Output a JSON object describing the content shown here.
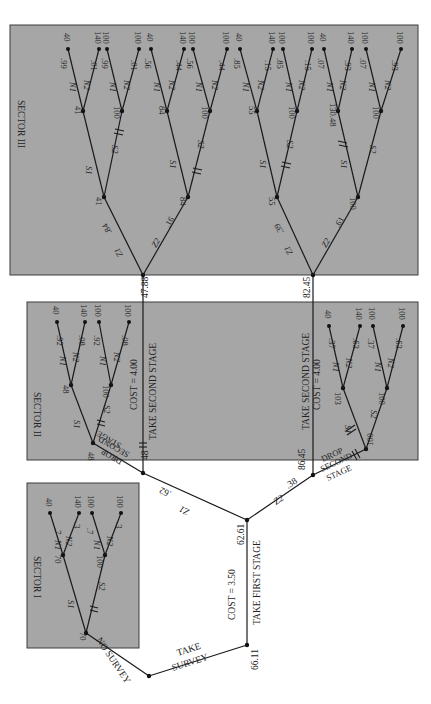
{
  "diagram": {
    "orientation": "rotated-90-clockwise",
    "colors": {
      "sector_fill": "#a6a6a6",
      "line": "#1a1a1a",
      "background": "#ffffff"
    },
    "root": {
      "label_a": "TAKE",
      "label_b": "SURVEY",
      "value": "66.11",
      "alt_branch": "NO SURVEY"
    },
    "first_stage": {
      "label": "TAKE FIRST STAGE",
      "cost": "COST = 3.50",
      "value": "62.61"
    },
    "z_branches": {
      "z1": "Z1",
      "z1_p": ".62",
      "z2": "Z2",
      "z2_p": ".38"
    },
    "sector1": {
      "title": "SECTOR I",
      "root_value": "70",
      "s1": "S1",
      "s2": "S2",
      "s1_node": "70",
      "s2_node": "100",
      "leaves": [
        {
          "branch": "N1",
          "p": ".7",
          "value": "40"
        },
        {
          "branch": "N2",
          "p": ".3",
          "value": "140"
        },
        {
          "branch": "N1",
          "p": ".7",
          "value": "100"
        },
        {
          "branch": "N2",
          "p": ".3",
          "value": "100"
        }
      ]
    },
    "sector2": {
      "title": "SECTOR II",
      "upper": {
        "node_value": "48",
        "take_label": "TAKE SECOND STAGE",
        "cost": "COST = 4.00",
        "take_value": "47.88",
        "drop_label": [
          "DROP",
          "SECOND",
          "STAGE"
        ],
        "drop_value": "48",
        "s1": "S1",
        "s2": "S2",
        "s1_node": "48",
        "s2_node": "100",
        "leaves": [
          {
            "branch": "N1",
            "p": ".92",
            "value": "40"
          },
          {
            "branch": "N2",
            "p": ".08",
            "value": "140"
          },
          {
            "branch": "N1",
            "p": ".92",
            "value": "100"
          },
          {
            "branch": "N2",
            "p": ".08",
            "value": "100"
          }
        ]
      },
      "lower": {
        "node_value": "86.45",
        "take_label": "TAKE SECOND STAGE",
        "cost": "COST = 4.00",
        "take_value": "82.45",
        "drop_label": [
          "DROP",
          "SECOND",
          "STAGE"
        ],
        "drop_value": "100",
        "s1": "S1",
        "s2": "S2",
        "s1_node": "103",
        "s2_node": "100",
        "leaves": [
          {
            "branch": "N1",
            "p": ".37",
            "value": "40"
          },
          {
            "branch": "N2",
            "p": ".63",
            "value": "140"
          },
          {
            "branch": "N1",
            "p": ".37",
            "value": "100"
          },
          {
            "branch": "N2",
            "p": ".63",
            "value": "100"
          }
        ]
      }
    },
    "sector3": {
      "title": "SECTOR III",
      "upper": {
        "z1": "Z1",
        "z1_p": ".84",
        "z2": "Z2",
        "z2_p": ".16",
        "z1_node": "41",
        "z2_node": "84",
        "z1_sub": {
          "s1": "S1",
          "s2": "S2",
          "s1_node": "41",
          "s2_node": "100",
          "leaves": [
            {
              "branch": "N1",
              "p": ".99",
              "value": "40"
            },
            {
              "branch": "N2",
              "p": ".01",
              "value": "140"
            },
            {
              "branch": "N1",
              "p": ".99",
              "value": "100"
            },
            {
              "branch": "N2",
              "p": ".01",
              "value": "100"
            }
          ]
        },
        "z2_sub": {
          "s1": "S1",
          "s2": "S2",
          "s1_node": "84",
          "s2_node": "100",
          "leaves": [
            {
              "branch": "N1",
              "p": ".56",
              "value": "40"
            },
            {
              "branch": "N2",
              "p": ".44",
              "value": "140"
            },
            {
              "branch": "N1",
              "p": ".56",
              "value": "100"
            },
            {
              "branch": "N2",
              "p": ".44",
              "value": "100"
            }
          ]
        }
      },
      "lower": {
        "z1": "Z1",
        "z1_p": ".39",
        "z2": "Z2",
        "z2_p": ".61",
        "z1_node": "55",
        "z2_node": "100",
        "z1_sub": {
          "s1": "S1",
          "s2": "S2",
          "s1_node": "55",
          "s2_node": "100",
          "leaves": [
            {
              "branch": "N1",
              "p": ".85",
              "value": "40"
            },
            {
              "branch": "N2",
              "p": ".15",
              "value": "140"
            },
            {
              "branch": "N1",
              "p": ".85",
              "value": "100"
            },
            {
              "branch": "N2",
              "p": ".15",
              "value": "100"
            }
          ]
        },
        "z2_sub": {
          "s1": "S1",
          "s2": "S2",
          "s1_node": "130.48",
          "s2_node": "100",
          "leaves": [
            {
              "branch": "N1",
              "p": ".07",
              "value": "40"
            },
            {
              "branch": "N2",
              "p": ".93",
              "value": "140"
            },
            {
              "branch": "N1",
              "p": ".07",
              "value": "100"
            },
            {
              "branch": "N2",
              "p": ".93",
              "value": "100"
            }
          ]
        }
      }
    }
  }
}
